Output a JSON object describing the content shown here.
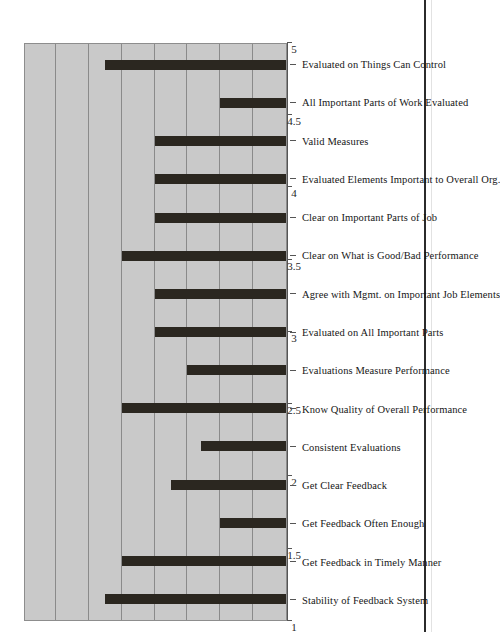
{
  "chart_data": {
    "type": "bar",
    "title": "",
    "subtitle": "",
    "xlabel": "",
    "ylabel": "",
    "orientation": "vertical-bars-rotated-90",
    "ylim": [
      1,
      5
    ],
    "ytick_labels": [
      "1",
      "1.5",
      "2",
      "2.5",
      "3",
      "3.5",
      "4",
      "4.5",
      "5"
    ],
    "ytick_values": [
      1,
      1.5,
      2,
      2.5,
      3,
      3.5,
      4,
      4.5,
      5
    ],
    "grid": "horizontal",
    "legend": "none",
    "plot_background": "#c9c9c9",
    "bar_color": "#2b2720",
    "categories": [
      "Stability of Feedback System",
      "Get Feedback in Timely Manner",
      "Get Feedback Often Enough",
      "Get Clear Feedback",
      "Consistent Evaluations",
      "Know Quality of Overall Performance",
      "Evaluations Measure Performance",
      "Evaluated on All Important Parts",
      "Agree with Mgmt. on Important Job Elements",
      "Clear on What is Good/Bad Performance",
      "Clear on Important Parts of Job",
      "Evaluated Elements Important to Overall Org.",
      "Valid Measures",
      "All Important Parts of Work Evaluated",
      "Evaluated on Things Can Control"
    ],
    "values": [
      3.75,
      3.5,
      2.0,
      2.75,
      2.3,
      3.5,
      2.5,
      3.0,
      3.0,
      3.5,
      3.0,
      3.0,
      3.0,
      2.0,
      3.75
    ]
  }
}
